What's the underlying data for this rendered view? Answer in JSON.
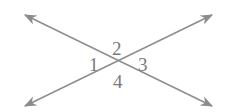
{
  "diagram": {
    "type": "intersecting-lines",
    "line_color": "#8c8c8c",
    "label_color": "#7a7a7a",
    "intersection": [
      118,
      63
    ],
    "lines": [
      {
        "name": "line-a",
        "from": [
          25,
          15
        ],
        "to": [
          212,
          106
        ],
        "arrows": "both"
      },
      {
        "name": "line-b",
        "from": [
          25,
          106
        ],
        "to": [
          212,
          15
        ],
        "arrows": "both"
      }
    ],
    "angles": [
      {
        "label": "1",
        "position": "left"
      },
      {
        "label": "2",
        "position": "top"
      },
      {
        "label": "3",
        "position": "right"
      },
      {
        "label": "4",
        "position": "bottom"
      }
    ]
  }
}
